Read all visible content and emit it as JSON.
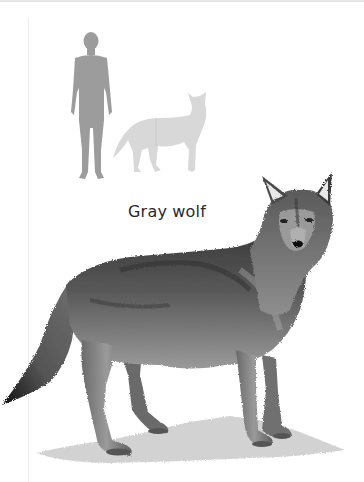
{
  "label": {
    "species_name": "Gray wolf"
  },
  "scale_figure": {
    "human_silhouette_color": "#9a9a9a",
    "wolf_silhouette_color": "#d6d6d6"
  },
  "illustration": {
    "subject": "gray wolf standing, head turned toward viewer",
    "ground_shadow_color": "#cfcfcf"
  }
}
